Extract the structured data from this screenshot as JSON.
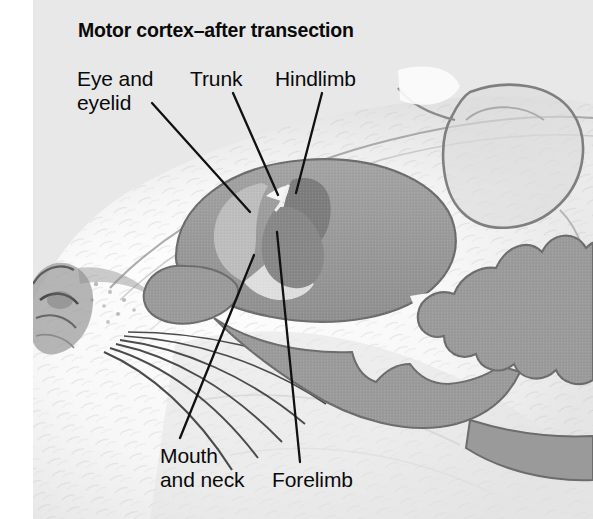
{
  "figure": {
    "title": "Motor cortex–after transection",
    "width": 593,
    "height": 519,
    "background_color": "#e8e8e8",
    "page_color": "#ffffff"
  },
  "labels": {
    "eye_and_eyelid": "Eye and\neyelid",
    "trunk": "Trunk",
    "hindlimb": "Hindlimb",
    "mouth_and_neck": "Mouth\nand neck",
    "forelimb": "Forelimb"
  },
  "colors": {
    "brain_body": "#9a9a9a",
    "brain_outline": "#6e6e6e",
    "eye_eyelid_region": "#bcbcbc",
    "trunk_region": "#f2f2f2",
    "hindlimb_region": "#7b7b7b",
    "forelimb_region": "#868686",
    "mouth_neck_region": "#dcdcdc",
    "leader_line": "#111111",
    "text": "#0a0a0a",
    "fur_light": "#fbfbfb",
    "fur_shadow": "#c9c9c9",
    "snout_dark": "#4a4a4a",
    "whisker": "#454545"
  },
  "anatomy": {
    "parts": [
      "cerebral-cortex",
      "olfactory-bulb",
      "brainstem",
      "cerebellum",
      "mouse-head",
      "mouse-ear",
      "mouse-snout",
      "whiskers"
    ]
  },
  "leader_lines": [
    {
      "name": "eye-and-eyelid-leader",
      "x1": 152,
      "y1": 103,
      "x2": 250,
      "y2": 212
    },
    {
      "name": "trunk-leader",
      "x1": 233,
      "y1": 93,
      "x2": 278,
      "y2": 195
    },
    {
      "name": "hindlimb-leader",
      "x1": 322,
      "y1": 93,
      "x2": 296,
      "y2": 193
    },
    {
      "name": "mouth-and-neck-leader",
      "x1": 180,
      "y1": 438,
      "x2": 254,
      "y2": 255
    },
    {
      "name": "forelimb-leader",
      "x1": 300,
      "y1": 462,
      "x2": 277,
      "y2": 232
    }
  ]
}
